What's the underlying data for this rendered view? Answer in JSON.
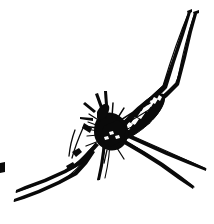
{
  "image": {
    "kind": "line-drawing",
    "subject": "mosquito",
    "technique": "black ink brush sketch",
    "background_color": "#ffffff",
    "ink_color": "#0a0a0a",
    "width": 214,
    "height": 224,
    "alt_text": "Hand-drawn black ink sketch of a mosquito with a speckled abdomen and long splayed legs on a white background",
    "title_text": "Mosquito",
    "visible_text": ""
  },
  "parts": {
    "abdomen": {
      "label": "abdomen",
      "description": "Dark tapered body angled up to the right with white banded scale marks",
      "color": "#0a0a0a",
      "band_color": "#ffffff",
      "band_count": 9
    },
    "thorax": {
      "label": "thorax",
      "description": "Dense black mass at the center where legs and wings converge",
      "color": "#0a0a0a"
    },
    "head": {
      "label": "head-and-proboscis",
      "description": "Small dark head with proboscis pointing up-left",
      "color": "#0a0a0a"
    },
    "wing": {
      "label": "wing",
      "description": "Narrow hatched wing overlapping the abdomen",
      "color": "#0a0a0a"
    },
    "legs": [
      {
        "label": "hind-leg-upper-right-outer",
        "direction": "up-right",
        "segments": 3
      },
      {
        "label": "hind-leg-upper-right-inner",
        "direction": "up-right",
        "segments": 3
      },
      {
        "label": "mid-leg-lower-right-upper",
        "direction": "down-right",
        "segments": 2
      },
      {
        "label": "mid-leg-lower-right-lower",
        "direction": "down-right",
        "segments": 2
      },
      {
        "label": "fore-leg-lower-left-upper",
        "direction": "down-left",
        "segments": 3
      },
      {
        "label": "fore-leg-lower-left-lower",
        "direction": "down-left",
        "segments": 3
      },
      {
        "label": "fore-leg-down-center",
        "direction": "down",
        "segments": 2
      }
    ],
    "stray_mark": {
      "label": "stray-ink-mark",
      "description": "Small detached ink dash at the left edge"
    }
  }
}
